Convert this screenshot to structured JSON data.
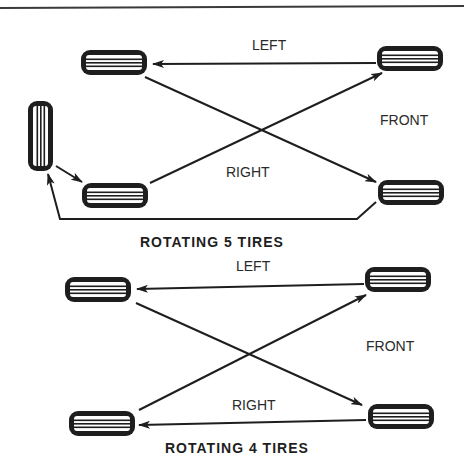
{
  "diagrams": [
    {
      "title": "ROTATING 5 TIRES",
      "labels": {
        "left": "LEFT",
        "right": "RIGHT",
        "front": "FRONT"
      }
    },
    {
      "title": "ROTATING 4 TIRES",
      "labels": {
        "left": "LEFT",
        "right": "RIGHT",
        "front": "FRONT"
      }
    }
  ],
  "colors": {
    "ink": "#1e1e1e",
    "background": "#ffffff"
  }
}
